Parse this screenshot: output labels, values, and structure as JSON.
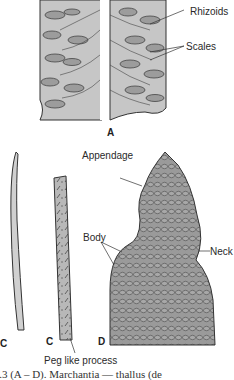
{
  "figure": {
    "panels": {
      "a": {
        "letter": "A",
        "labels": {
          "rhizoids": "Rhizoids",
          "scales": "Scales"
        }
      },
      "c1": {
        "letter": "C"
      },
      "c2": {
        "letter": "C",
        "labels": {
          "peg": "Peg like process"
        }
      },
      "d": {
        "letter": "D",
        "labels": {
          "appendage": "Appendage",
          "body": "Body",
          "neck": "Neck"
        }
      }
    },
    "caption": "e 5.3  (A – D).  Marchantia — thallus (de"
  }
}
